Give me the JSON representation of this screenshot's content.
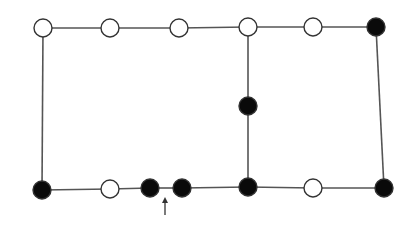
{
  "diagram": {
    "title": "",
    "colors": {
      "line": "#555555",
      "node_stroke": "#333333",
      "filled": "#0a0a0a",
      "open": "#ffffff",
      "background": "#ffffff"
    },
    "node_radius": 9,
    "nodes": [
      {
        "id": "t1",
        "x": 43,
        "y": 28,
        "type": "open"
      },
      {
        "id": "t2",
        "x": 110,
        "y": 28,
        "type": "open"
      },
      {
        "id": "t3",
        "x": 179,
        "y": 28,
        "type": "open"
      },
      {
        "id": "t4",
        "x": 248,
        "y": 27,
        "type": "open"
      },
      {
        "id": "t5",
        "x": 313,
        "y": 27,
        "type": "open"
      },
      {
        "id": "t6",
        "x": 376,
        "y": 27,
        "type": "filled"
      },
      {
        "id": "m1",
        "x": 248,
        "y": 106,
        "type": "filled"
      },
      {
        "id": "b1",
        "x": 42,
        "y": 190,
        "type": "filled"
      },
      {
        "id": "b2",
        "x": 110,
        "y": 189,
        "type": "open"
      },
      {
        "id": "b3",
        "x": 150,
        "y": 188,
        "type": "filled"
      },
      {
        "id": "b4",
        "x": 182,
        "y": 188,
        "type": "filled"
      },
      {
        "id": "b5",
        "x": 248,
        "y": 187,
        "type": "filled"
      },
      {
        "id": "b6",
        "x": 313,
        "y": 188,
        "type": "open"
      },
      {
        "id": "b7",
        "x": 384,
        "y": 188,
        "type": "filled"
      }
    ],
    "edges": [
      [
        "t1",
        "t2"
      ],
      [
        "t2",
        "t3"
      ],
      [
        "t3",
        "t4"
      ],
      [
        "t4",
        "t5"
      ],
      [
        "t5",
        "t6"
      ],
      [
        "t1",
        "b1"
      ],
      [
        "t4",
        "m1"
      ],
      [
        "m1",
        "b5"
      ],
      [
        "t6",
        "b7"
      ],
      [
        "b1",
        "b2"
      ],
      [
        "b2",
        "b3"
      ],
      [
        "b3",
        "b4"
      ],
      [
        "b4",
        "b5"
      ],
      [
        "b5",
        "b6"
      ],
      [
        "b6",
        "b7"
      ]
    ],
    "arrow": {
      "x": 165,
      "y_tail": 215,
      "y_head": 197,
      "label": ""
    }
  }
}
